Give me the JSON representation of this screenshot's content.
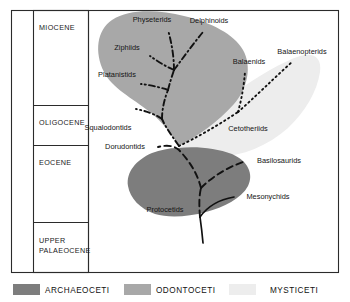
{
  "figure": {
    "epoch_column": {
      "name": "geologic-epoch-column",
      "epochs": [
        {
          "label": "MIOCENE"
        },
        {
          "label": "OLIGOCENE"
        },
        {
          "label": "EOCENE"
        },
        {
          "label": "UPPER\nPALAEOCENE",
          "line1": "UPPER",
          "line2": "PALAEOCENE"
        }
      ]
    },
    "clades": [
      {
        "key": "archaeoceti",
        "label": "ARCHAEOCETI",
        "color": "#7d7d7d",
        "branch_style": "dashed"
      },
      {
        "key": "odontoceti",
        "label": "ODONTOCETI",
        "color": "#a8a8a8",
        "branch_style": "dash-dot"
      },
      {
        "key": "mysticeti",
        "label": "MYSTICETI",
        "color": "#ededed",
        "branch_style": "dotted"
      }
    ],
    "taxa": [
      {
        "name": "Physeterids",
        "clade": "odontoceti",
        "x": 152,
        "y": 22
      },
      {
        "name": "Delphinoids",
        "clade": "odontoceti",
        "x": 196,
        "y": 23
      },
      {
        "name": "Ziphiids",
        "clade": "odontoceti",
        "x": 127,
        "y": 50
      },
      {
        "name": "Platanistids",
        "clade": "odontoceti",
        "x": 110,
        "y": 77
      },
      {
        "name": "Squalodontids",
        "clade": "odontoceti",
        "x": 100,
        "y": 130
      },
      {
        "name": "Balaenids",
        "clade": "mysticeti",
        "x": 234,
        "y": 62
      },
      {
        "name": "Balaenopterids",
        "clade": "mysticeti",
        "x": 279,
        "y": 52
      },
      {
        "name": "Cetotheriids",
        "clade": "mysticeti",
        "x": 225,
        "y": 130
      },
      {
        "name": "Dorudontids",
        "clade": "archaeoceti",
        "x": 114,
        "y": 148
      },
      {
        "name": "Basilosaurids",
        "clade": "archaeoceti",
        "x": 251,
        "y": 163
      },
      {
        "name": "Protocetids",
        "clade": "archaeoceti",
        "x": 152,
        "y": 212
      },
      {
        "name": "Mesonychids",
        "clade": "outgroup",
        "x": 240,
        "y": 199
      }
    ],
    "root_node": {
      "x": 178,
      "y": 146
    }
  }
}
